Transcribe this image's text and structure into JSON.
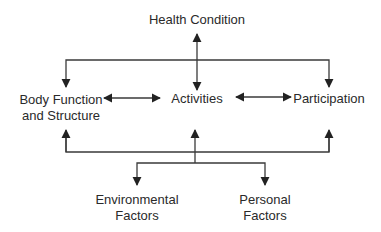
{
  "diagram": {
    "type": "flow",
    "colors": {
      "line": "#3a3a3a",
      "text": "#2a2a2a",
      "background": "#ffffff"
    },
    "nodes": {
      "health_condition": {
        "lines": [
          "Health Condition"
        ]
      },
      "body_function": {
        "lines": [
          "Body Function",
          "and Structure"
        ]
      },
      "activities": {
        "lines": [
          "Activities"
        ]
      },
      "participation": {
        "lines": [
          "Participation"
        ]
      },
      "environmental": {
        "lines": [
          "Environmental",
          "Factors"
        ]
      },
      "personal": {
        "lines": [
          "Personal",
          "Factors"
        ]
      }
    },
    "edges": [
      {
        "from": "health_condition",
        "to": "activities",
        "direction": "both"
      },
      {
        "from": "health_condition",
        "to": "body_function",
        "direction": "forward"
      },
      {
        "from": "health_condition",
        "to": "participation",
        "direction": "forward"
      },
      {
        "from": "body_function",
        "to": "activities",
        "direction": "both"
      },
      {
        "from": "activities",
        "to": "participation",
        "direction": "both"
      },
      {
        "from": "contextual_bus",
        "to": "body_function",
        "direction": "forward"
      },
      {
        "from": "contextual_bus",
        "to": "activities",
        "direction": "forward"
      },
      {
        "from": "contextual_bus",
        "to": "participation",
        "direction": "forward"
      },
      {
        "from": "contextual_bus",
        "to": "environmental",
        "direction": "forward"
      },
      {
        "from": "contextual_bus",
        "to": "personal",
        "direction": "forward"
      }
    ]
  }
}
